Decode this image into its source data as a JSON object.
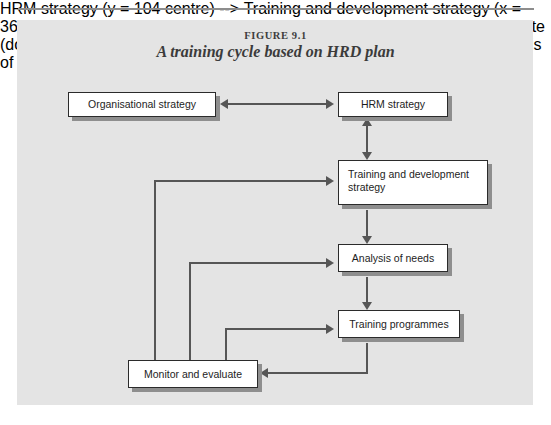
{
  "figure": {
    "label": "FIGURE 9.1",
    "title": "A training cycle based on HRD plan"
  },
  "colors": {
    "panel_background": "#e4e4e4",
    "box_fill": "#ffffff",
    "box_border": "#2b2b2b",
    "box_shadow": "#8e8e8e",
    "connector": "#565656",
    "text": "#1d1d1d",
    "title_text": "#3b3b3b",
    "rule": "#8d8d8d"
  },
  "diagram": {
    "type": "flowchart",
    "nodes": [
      {
        "id": "organisational-strategy",
        "label": "Organisational strategy",
        "align": "center"
      },
      {
        "id": "hrm-strategy",
        "label": "HRM strategy",
        "align": "center"
      },
      {
        "id": "training-and-development-strategy",
        "label": "Training and development strategy",
        "align": "left"
      },
      {
        "id": "analysis-of-needs",
        "label": "Analysis of needs",
        "align": "center"
      },
      {
        "id": "training-programmes",
        "label": "Training programmes",
        "align": "center"
      },
      {
        "id": "monitor-and-evaluate",
        "label": "Monitor and evaluate",
        "align": "center"
      }
    ],
    "edges": [
      {
        "from": "organisational-strategy",
        "to": "hrm-strategy",
        "direction": "bidirectional",
        "style": "straight-horizontal"
      },
      {
        "from": "hrm-strategy",
        "to": "training-and-development-strategy",
        "direction": "bidirectional",
        "style": "straight-vertical"
      },
      {
        "from": "training-and-development-strategy",
        "to": "analysis-of-needs",
        "direction": "forward",
        "style": "straight-vertical"
      },
      {
        "from": "analysis-of-needs",
        "to": "training-programmes",
        "direction": "forward",
        "style": "straight-vertical"
      },
      {
        "from": "training-programmes",
        "to": "monitor-and-evaluate",
        "direction": "forward",
        "style": "elbow-down-left"
      },
      {
        "from": "monitor-and-evaluate",
        "to": "training-and-development-strategy",
        "direction": "forward",
        "style": "feedback-elbow-up-right"
      },
      {
        "from": "monitor-and-evaluate",
        "to": "analysis-of-needs",
        "direction": "forward",
        "style": "feedback-elbow-up-right"
      },
      {
        "from": "monitor-and-evaluate",
        "to": "training-programmes",
        "direction": "forward",
        "style": "feedback-elbow-up-right"
      }
    ]
  }
}
